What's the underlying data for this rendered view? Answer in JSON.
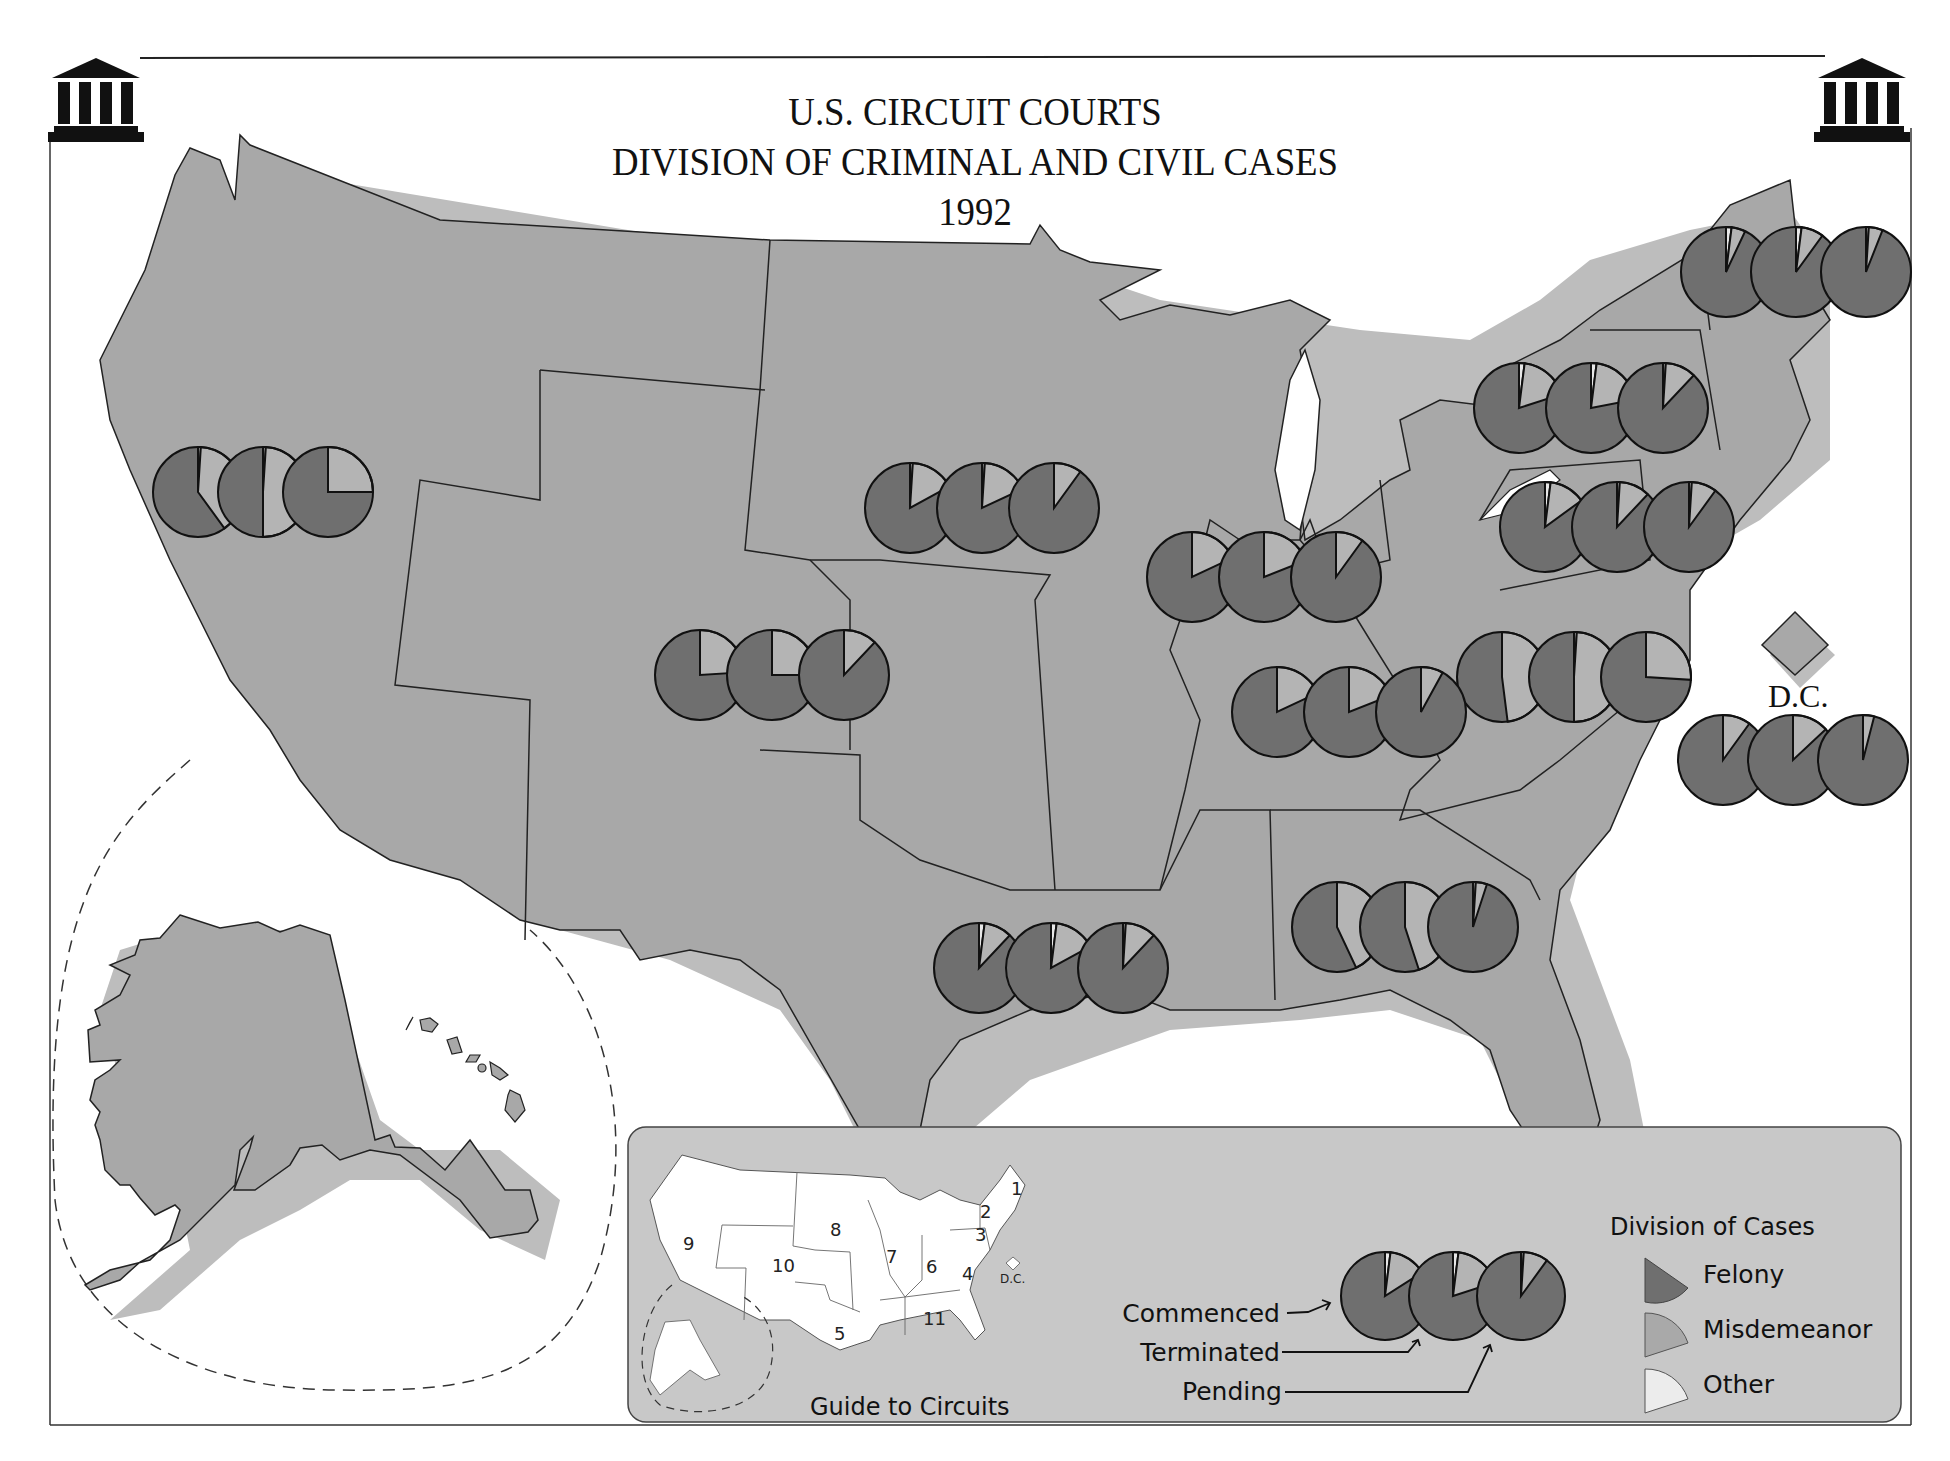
{
  "title": {
    "line1": "U.S. CIRCUIT COURTS",
    "line2": "DIVISION OF CRIMINAL AND CIVIL CASES",
    "line3": "1992"
  },
  "icons": {
    "left": "courthouse-icon",
    "right": "courthouse-icon"
  },
  "dc_label": "D.C.",
  "guide": {
    "title": "Guide to Circuits",
    "labels": [
      "1",
      "2",
      "3",
      "4",
      "5",
      "6",
      "7",
      "8",
      "9",
      "10",
      "11"
    ],
    "dc_label": "D.C."
  },
  "legend": {
    "title": "Division of Cases",
    "items": [
      {
        "label": "Felony",
        "color": "#6f6f6f"
      },
      {
        "label": "Misdemeanor",
        "color": "#a9a9a9"
      },
      {
        "label": "Other",
        "color": "#e4e4e4"
      }
    ],
    "pie_labels": [
      "Commenced",
      "Terminated",
      "Pending"
    ]
  },
  "colors": {
    "land": "#a8a8a8",
    "shadow": "#bdbdbd",
    "panel": "#c8c8c8",
    "felony": "#6f6f6f",
    "misdemeanor": "#b4b4b4",
    "other": "#e8e8e8"
  },
  "chart_data": {
    "type": "pie",
    "categories": [
      "Felony",
      "Misdemeanor",
      "Other"
    ],
    "pie_order": [
      "Commenced",
      "Terminated",
      "Pending"
    ],
    "units": "percent (estimated from wedge angles)",
    "circuits": [
      {
        "circuit": "1",
        "commenced": [
          93,
          5,
          2
        ],
        "terminated": [
          90,
          8,
          2
        ],
        "pending": [
          94,
          5,
          1
        ]
      },
      {
        "circuit": "2",
        "commenced": [
          80,
          18,
          2
        ],
        "terminated": [
          78,
          20,
          2
        ],
        "pending": [
          88,
          11,
          1
        ]
      },
      {
        "circuit": "3",
        "commenced": [
          85,
          13,
          2
        ],
        "terminated": [
          88,
          11,
          1
        ],
        "pending": [
          90,
          9,
          1
        ]
      },
      {
        "circuit": "4",
        "commenced": [
          52,
          48,
          0
        ],
        "terminated": [
          50,
          49,
          1
        ],
        "pending": [
          74,
          26,
          0
        ]
      },
      {
        "circuit": "5",
        "commenced": [
          88,
          10,
          2
        ],
        "terminated": [
          83,
          15,
          2
        ],
        "pending": [
          88,
          11,
          1
        ]
      },
      {
        "circuit": "6",
        "commenced": [
          82,
          18,
          0
        ],
        "terminated": [
          81,
          19,
          0
        ],
        "pending": [
          92,
          8,
          0
        ]
      },
      {
        "circuit": "7",
        "commenced": [
          82,
          18,
          0
        ],
        "terminated": [
          81,
          19,
          0
        ],
        "pending": [
          90,
          10,
          0
        ]
      },
      {
        "circuit": "8",
        "commenced": [
          83,
          16,
          1
        ],
        "terminated": [
          82,
          17,
          1
        ],
        "pending": [
          90,
          10,
          0
        ]
      },
      {
        "circuit": "9",
        "commenced": [
          60,
          39,
          1
        ],
        "terminated": [
          50,
          49,
          1
        ],
        "pending": [
          75,
          25,
          0
        ]
      },
      {
        "circuit": "10",
        "commenced": [
          76,
          24,
          0
        ],
        "terminated": [
          75,
          25,
          0
        ],
        "pending": [
          88,
          12,
          0
        ]
      },
      {
        "circuit": "11",
        "commenced": [
          57,
          43,
          0
        ],
        "terminated": [
          55,
          45,
          0
        ],
        "pending": [
          95,
          4,
          1
        ]
      },
      {
        "circuit": "D.C.",
        "commenced": [
          90,
          10,
          0
        ],
        "terminated": [
          87,
          13,
          0
        ],
        "pending": [
          96,
          4,
          0
        ]
      }
    ],
    "legend_example": {
      "commenced": [
        84,
        14,
        2
      ],
      "terminated": [
        80,
        18,
        2
      ],
      "pending": [
        90,
        9,
        1
      ]
    }
  }
}
